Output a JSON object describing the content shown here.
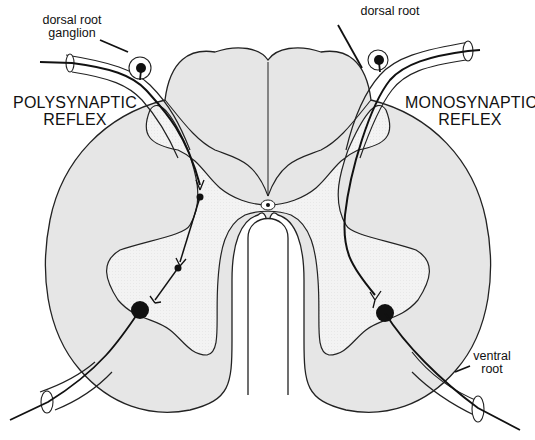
{
  "diagram": {
    "type": "spinal cord cross-section reflex arcs",
    "colors": {
      "white_matter": "#e6e6e6",
      "gray_matter": "#f4f4f4",
      "outline": "#222222",
      "neuron": "#111111",
      "background": "#ffffff"
    }
  },
  "labels": {
    "left_title_line1": "POLYSYNAPTIC",
    "left_title_line2": "REFLEX",
    "right_title_line1": "MONOSYNAPTIC",
    "right_title_line2": "REFLEX",
    "left_ganglion_line1": "dorsal root",
    "left_ganglion_line2": "ganglion",
    "right_dorsal_root": "dorsal root",
    "right_ventral_root_line1": "ventral",
    "right_ventral_root_line2": "root"
  }
}
